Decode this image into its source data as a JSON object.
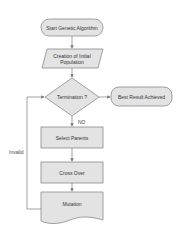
{
  "diagram": {
    "type": "flowchart",
    "nodes": [
      {
        "id": "start",
        "shape": "terminal",
        "label": "Start Genetic Algorithm"
      },
      {
        "id": "init",
        "shape": "parallelogram",
        "label": "Creation of Initial Population"
      },
      {
        "id": "term",
        "shape": "decision",
        "label": "Termination ?"
      },
      {
        "id": "best",
        "shape": "terminal",
        "label": "Best Result Achieved"
      },
      {
        "id": "select",
        "shape": "process",
        "label": "Select Parents"
      },
      {
        "id": "cross",
        "shape": "process",
        "label": "Cross Over"
      },
      {
        "id": "mutation",
        "shape": "document",
        "label": "Mutation"
      }
    ],
    "edges": [
      {
        "from": "start",
        "to": "init",
        "label": ""
      },
      {
        "from": "init",
        "to": "term",
        "label": ""
      },
      {
        "from": "term",
        "to": "best",
        "label": ""
      },
      {
        "from": "term",
        "to": "select",
        "label": "NO"
      },
      {
        "from": "select",
        "to": "cross",
        "label": ""
      },
      {
        "from": "cross",
        "to": "mutation",
        "label": ""
      },
      {
        "from": "mutation",
        "to": "term",
        "label": "Invalid"
      }
    ],
    "labels": {
      "no": "NO",
      "invalid": "Invalid"
    },
    "colors": {
      "fill": "#e3e3e3",
      "stroke": "#8a8a8a",
      "arrow": "#7a7a7a"
    }
  }
}
